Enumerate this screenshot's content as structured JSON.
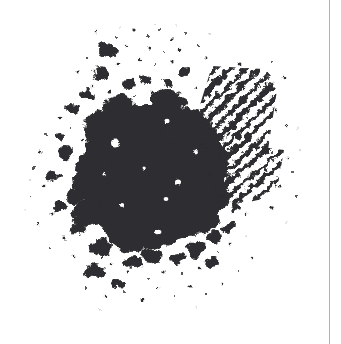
{
  "page": {
    "width": 341,
    "height": 344,
    "background_color": "#ffffff",
    "caption": "Scanned ink blot splatter on white paper"
  },
  "page_edge": {
    "name": "page-edge-rule",
    "x": 329,
    "color": "#b3b3b3",
    "width": 1
  },
  "artwork": {
    "title": "Ink Blot Splatter",
    "ink_color": "#2e2e30",
    "ink_color_soft": "#3a3a3c",
    "ink_color_faint": "#9a9a9e",
    "bounds": {
      "x": 25,
      "y": 28,
      "width": 278,
      "height": 275
    },
    "core": {
      "name": "ink-core-mass",
      "center_x": 155,
      "center_y": 175,
      "radius_x": 72,
      "radius_y": 70
    },
    "hatch_bands": [
      {
        "name": "hatch-band-upper-right",
        "angle_deg": 45,
        "x": 190,
        "y": 62,
        "width": 88,
        "height": 100,
        "stroke_count": 13
      },
      {
        "name": "hatch-band-right",
        "angle_deg": 40,
        "x": 205,
        "y": 138,
        "width": 80,
        "height": 60,
        "stroke_count": 8
      }
    ],
    "void_count": 9,
    "speckle_count": 150
  }
}
